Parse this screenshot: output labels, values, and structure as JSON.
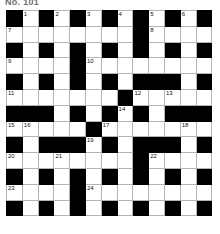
{
  "title": "No. 101",
  "puzzle": {
    "type": "crossword",
    "columns": 13,
    "rows": 13,
    "cell_size_px": 15.8,
    "colors": {
      "block": "#000000",
      "cell": "#ffffff",
      "gridline": "#b4b4b4",
      "number": "#111111",
      "title": "#6f6f6f"
    },
    "grid": [
      [
        "#",
        "",
        "#",
        "",
        "#",
        "",
        "#",
        "",
        "#",
        "",
        "#",
        "",
        "#"
      ],
      [
        "",
        "",
        "",
        "",
        "",
        "",
        "",
        "",
        "#",
        "",
        "",
        "",
        ""
      ],
      [
        "#",
        "",
        "#",
        "",
        "#",
        "",
        "#",
        "",
        "#",
        "",
        "#",
        "",
        "#"
      ],
      [
        "",
        "",
        "",
        "",
        "#",
        "",
        "",
        "",
        "",
        "",
        "",
        "",
        ""
      ],
      [
        "#",
        "",
        "#",
        "",
        "#",
        "",
        "#",
        "",
        "#",
        "#",
        "#",
        "",
        "#"
      ],
      [
        "",
        "",
        "",
        "",
        "",
        "",
        "",
        "#",
        "",
        "",
        "",
        "",
        ""
      ],
      [
        "#",
        "#",
        "#",
        "",
        "#",
        "",
        "#",
        "",
        "#",
        "",
        "#",
        "#",
        "#"
      ],
      [
        "",
        "",
        "",
        "",
        "",
        "#",
        "",
        "",
        "",
        "",
        "",
        "",
        ""
      ],
      [
        "#",
        "",
        "#",
        "#",
        "#",
        "",
        "#",
        "",
        "#",
        "#",
        "#",
        "",
        "#"
      ],
      [
        "",
        "",
        "",
        "",
        "",
        "",
        "",
        "",
        "#",
        "",
        "",
        "",
        ""
      ],
      [
        "#",
        "",
        "#",
        "",
        "#",
        "",
        "#",
        "",
        "#",
        "",
        "#",
        "",
        "#"
      ],
      [
        "",
        "",
        "",
        "",
        "#",
        "",
        "",
        "",
        "",
        "",
        "",
        "",
        ""
      ],
      [
        "#",
        "",
        "#",
        "",
        "#",
        "",
        "#",
        "",
        "#",
        "",
        "#",
        "",
        "#"
      ]
    ],
    "numbers": [
      {
        "n": "1",
        "row": 1,
        "col": 2
      },
      {
        "n": "2",
        "row": 1,
        "col": 4
      },
      {
        "n": "3",
        "row": 1,
        "col": 6
      },
      {
        "n": "4",
        "row": 1,
        "col": 8
      },
      {
        "n": "5",
        "row": 1,
        "col": 10
      },
      {
        "n": "6",
        "row": 1,
        "col": 12
      },
      {
        "n": "7",
        "row": 2,
        "col": 1
      },
      {
        "n": "8",
        "row": 2,
        "col": 10
      },
      {
        "n": "9",
        "row": 4,
        "col": 1
      },
      {
        "n": "10",
        "row": 4,
        "col": 6
      },
      {
        "n": "11",
        "row": 6,
        "col": 1
      },
      {
        "n": "12",
        "row": 6,
        "col": 9
      },
      {
        "n": "13",
        "row": 6,
        "col": 11
      },
      {
        "n": "14",
        "row": 7,
        "col": 8
      },
      {
        "n": "15",
        "row": 8,
        "col": 1
      },
      {
        "n": "16",
        "row": 8,
        "col": 2
      },
      {
        "n": "17",
        "row": 8,
        "col": 7
      },
      {
        "n": "18",
        "row": 8,
        "col": 12
      },
      {
        "n": "19",
        "row": 9,
        "col": 6
      },
      {
        "n": "20",
        "row": 10,
        "col": 1
      },
      {
        "n": "21",
        "row": 10,
        "col": 4
      },
      {
        "n": "22",
        "row": 10,
        "col": 10
      },
      {
        "n": "23",
        "row": 12,
        "col": 1
      },
      {
        "n": "24",
        "row": 12,
        "col": 6
      }
    ]
  }
}
